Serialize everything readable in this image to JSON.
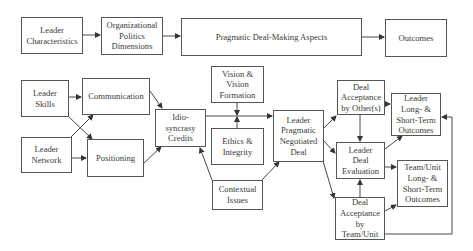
{
  "diagram": {
    "top_row": {
      "leader_characteristics": "Leader\nCharacteristics",
      "org_politics": "Organizational\nPolitics\nDimensions",
      "pragmatic_aspects": "Pragmatic Deal-Making Aspects",
      "outcomes": "Outcomes"
    },
    "detail": {
      "leader_skills": "Leader\nSkills",
      "leader_network": "Leader\nNetwork",
      "communication": "Communication",
      "positioning": "Positioning",
      "idiosyncrasy_credits": "Idio-\nsyncrasy\nCredits",
      "vision": "Vision &\nVision\nFormation",
      "ethics": "Ethics &\nIntegrity",
      "contextual_issues": "Contextual\nIssues",
      "negotiated_deal": "Leader\nPragmatic\nNegotiated\nDeal",
      "acceptance_others": "Deal\nAcceptance\nby Other(s)",
      "leader_evaluation": "Leader\nDeal\nEvaluation",
      "acceptance_team": "Deal\nAcceptance\nby\nTeam/Unit",
      "leader_outcomes": "Leader\nLong- &\nShort-Term\nOutcomes",
      "team_outcomes": "Team/Unit\nLong- &\nShort-Term\nOutcomes"
    },
    "colors": {
      "line": "#333333",
      "border": "#555555",
      "text": "#3a3a3a"
    }
  }
}
